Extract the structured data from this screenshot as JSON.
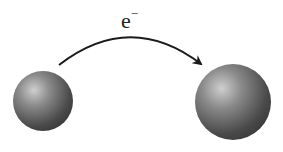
{
  "diagram": {
    "label": {
      "base": "e",
      "superscript": "−"
    },
    "atoms": [
      {
        "name": "donor",
        "cx": 43,
        "cy": 101,
        "r": 30
      },
      {
        "name": "acceptor",
        "cx": 233,
        "cy": 102,
        "r": 38
      }
    ],
    "arrow": {
      "from": "donor",
      "to": "acceptor"
    },
    "colors": {
      "sphere_dark": "#3a3a3a",
      "sphere_light": "#c8c8c8",
      "arrow": "#1a1a1a"
    }
  }
}
